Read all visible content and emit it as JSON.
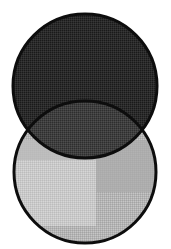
{
  "figure": {
    "title": "Two-circle Venn diagram",
    "background_color": "#ffffff",
    "width": 171,
    "height": 249
  },
  "chart_data": {
    "type": "venn",
    "title": "Two-circle Venn diagram",
    "subtitle": "",
    "xlabel": "",
    "ylabel": "",
    "grid": false,
    "legend": false,
    "sets": [
      {
        "name": "top-circle",
        "label": "",
        "center_x": 85,
        "center_y": 86,
        "radius": 72,
        "fill_color": "#2b2b2b",
        "fill_description": "very dark gray dithered halftone",
        "stroke_color": "#0d0d0d",
        "stroke_width": 3
      },
      {
        "name": "bottom-circle",
        "label": "",
        "center_x": 85,
        "center_y": 172,
        "radius": 71,
        "fill_color": "#b4b4b4",
        "fill_description": "light gray dithered halftone",
        "stroke_color": "#0d0d0d",
        "stroke_width": 3
      }
    ],
    "regions": [
      {
        "name": "top-only",
        "belongs_to": [
          "top-circle"
        ],
        "fill_color": "#2b2b2b",
        "shade": "darkest"
      },
      {
        "name": "intersection",
        "belongs_to": [
          "top-circle",
          "bottom-circle"
        ],
        "fill_color": "#3f3f3f",
        "shade": "medium-dark"
      },
      {
        "name": "bottom-only",
        "belongs_to": [
          "bottom-circle"
        ],
        "fill_color": "#b4b4b4",
        "shade": "light"
      }
    ],
    "intersection_points": [
      {
        "x": 22,
        "y": 130
      },
      {
        "x": 148,
        "y": 130
      }
    ],
    "texture_patches": [
      {
        "name": "bottom-left-lighter-patch",
        "x": 14,
        "y": 160,
        "width": 82,
        "height": 66,
        "fill_color": "#c9c9c9"
      },
      {
        "name": "bottom-left-upper-patch",
        "x": 14,
        "y": 140,
        "width": 82,
        "height": 20,
        "fill_color": "#bdbdbd"
      },
      {
        "name": "bottom-right-patch",
        "x": 96,
        "y": 140,
        "width": 62,
        "height": 52,
        "fill_color": "#ababab"
      }
    ],
    "annotations": []
  }
}
